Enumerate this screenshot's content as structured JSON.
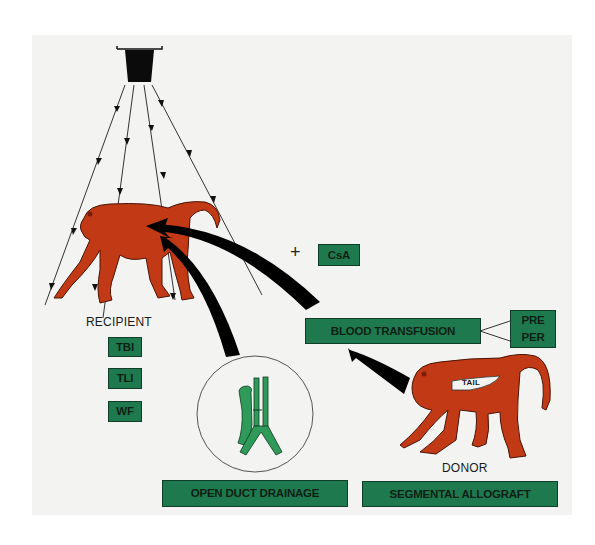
{
  "diagram": {
    "colors": {
      "background": "#f3f4f2",
      "box_green": "#1e7a4e",
      "monkey_red": "#c23a15",
      "duct_green": "#2f9a5a",
      "arrow": "#000000"
    },
    "irradiation_source": {
      "icon": "radiation-source-icon",
      "rays": 5
    },
    "recipient": {
      "label": "RECIPIENT",
      "treatments": [
        "TBI",
        "TLI",
        "WF"
      ]
    },
    "donor": {
      "label": "DONOR",
      "graft_label": "TAIL"
    },
    "csa": {
      "operator": "+",
      "label": "CsA"
    },
    "blood_transfusion": {
      "label": "BLOOD TRANSFUSION",
      "timing": [
        "PRE",
        "PER"
      ]
    },
    "bottom_labels": {
      "drainage": "OPEN DUCT DRAINAGE",
      "graft": "SEGMENTAL ALLOGRAFT"
    }
  }
}
